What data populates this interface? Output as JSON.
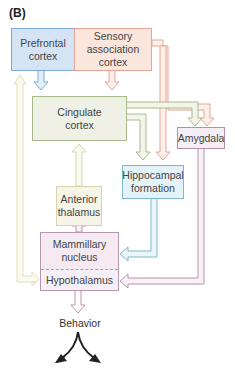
{
  "panel_label": "(B)",
  "nodes": {
    "prefrontal": {
      "label_line1": "Prefrontal",
      "label_line2": "cortex",
      "fill": "#d4e4f4",
      "border": "#7ea9d6"
    },
    "sensory": {
      "label_line1": "Sensory",
      "label_line2": "association",
      "label_line3": "cortex",
      "fill": "#fbe6dd",
      "border": "#e6a596"
    },
    "cingulate": {
      "label_line1": "Cingulate",
      "label_line2": "cortex",
      "fill": "#eff1e6",
      "border": "#a9b98c"
    },
    "amygdala": {
      "label": "Amygdala",
      "fill": "#f6eef4",
      "border": "#b58fa8"
    },
    "hippocampal": {
      "label_line1": "Hippocampal",
      "label_line2": "formation",
      "fill": "#e4f3f7",
      "border": "#7fb9c9"
    },
    "anterior_thalamus": {
      "label_line1": "Anterior",
      "label_line2": "thalamus",
      "fill": "#f6f5e8",
      "border": "#d6d4b0"
    },
    "mammillary": {
      "label_line1": "Mammillary",
      "label_line2": "nucleus",
      "fill": "#f5eaf1",
      "border": "#b795ab"
    },
    "hypothalamus": {
      "label": "Hypothalamus",
      "fill": "#f5f0f8",
      "border": "#b795ab"
    }
  },
  "output": {
    "label": "Behavior"
  },
  "diagram": {
    "type": "flow",
    "edges": [
      {
        "from": "Prefrontal cortex",
        "to": "Cingulate cortex"
      },
      {
        "from": "Sensory association cortex",
        "to": "Cingulate cortex"
      },
      {
        "from": "Sensory association cortex",
        "to": "Amygdala"
      },
      {
        "from": "Sensory association cortex",
        "to": "Hippocampal formation"
      },
      {
        "from": "Cingulate cortex",
        "to": "Amygdala"
      },
      {
        "from": "Cingulate cortex",
        "to": "Hippocampal formation"
      },
      {
        "from": "Anterior thalamus",
        "to": "Cingulate cortex"
      },
      {
        "from": "Mammillary nucleus",
        "to": "Anterior thalamus"
      },
      {
        "from": "Hippocampal formation",
        "to": "Mammillary nucleus"
      },
      {
        "from": "Amygdala",
        "to": "Hypothalamus"
      },
      {
        "from": "Hypothalamus",
        "to": "Prefrontal cortex"
      },
      {
        "from": "Hypothalamus",
        "to": "Behavior"
      }
    ]
  }
}
